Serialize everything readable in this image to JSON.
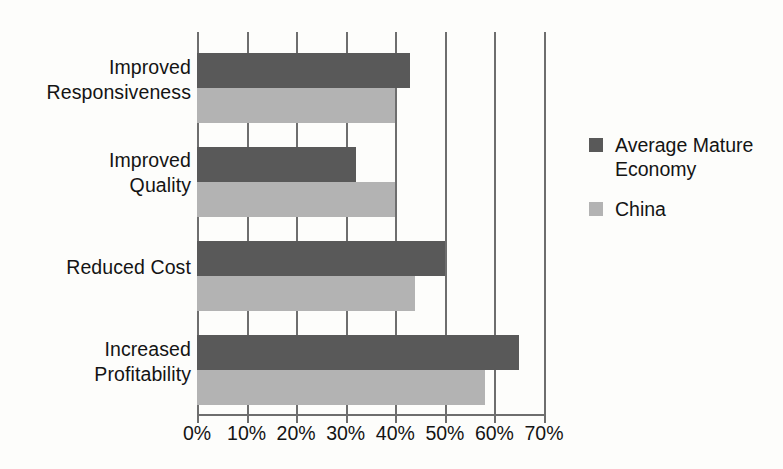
{
  "chart_data": {
    "type": "bar",
    "orientation": "horizontal",
    "title": "",
    "subtitle": "",
    "xlabel": "",
    "ylabel": "",
    "xlim": [
      0,
      70
    ],
    "xtick_labels": [
      "0%",
      "10%",
      "20%",
      "30%",
      "40%",
      "50%",
      "60%",
      "70%"
    ],
    "xtick_values": [
      0,
      10,
      20,
      30,
      40,
      50,
      60,
      70
    ],
    "grid": true,
    "grid_axis": "x",
    "legend_position": "right",
    "categories": [
      "Improved\nResponsiveness",
      "Improved\nQuality",
      "Reduced Cost",
      "Increased\nProfitability"
    ],
    "category_lines": [
      [
        "Improved",
        "Responsiveness"
      ],
      [
        "Improved",
        "Quality"
      ],
      [
        "Reduced Cost"
      ],
      [
        "Increased",
        "Profitability"
      ]
    ],
    "series": [
      {
        "name": "Average Mature Economy",
        "name_lines": [
          "Average Mature",
          "Economy"
        ],
        "color": "#595959",
        "values": [
          43,
          32,
          50,
          65
        ]
      },
      {
        "name": "China",
        "name_lines": [
          "China"
        ],
        "color": "#b3b3b3",
        "values": [
          40,
          40,
          44,
          58
        ]
      }
    ]
  },
  "colors": {
    "background": "#fdfdfb",
    "axis": "#6e6e6e",
    "text": "#141414",
    "series_dark": "#595959",
    "series_light": "#b3b3b3"
  }
}
